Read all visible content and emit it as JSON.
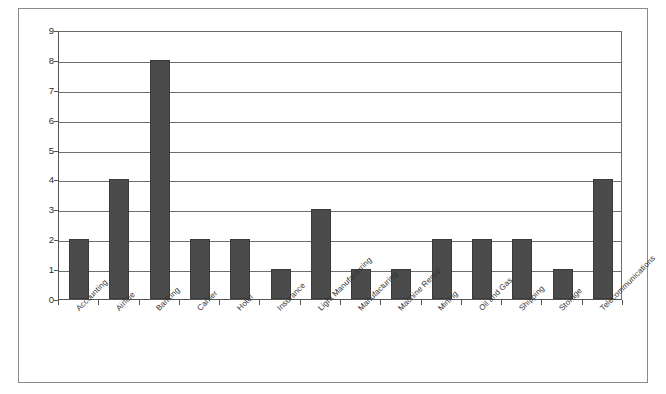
{
  "chart_data": {
    "type": "bar",
    "title": "",
    "subtitle": "",
    "xlabel": "",
    "ylabel": "",
    "categories": [
      "Accounting",
      "Airline",
      "Banking",
      "Carrier",
      "Hotel",
      "Insurance",
      "Light Manufacturing",
      "Manufacturing",
      "Machine Rental",
      "Mining",
      "Oil and Gas",
      "Shipping",
      "Storage",
      "Telecommunications"
    ],
    "values": [
      2,
      4,
      8,
      2,
      2,
      1,
      3,
      1,
      1,
      2,
      2,
      2,
      1,
      4
    ],
    "ylim": [
      0,
      9
    ],
    "ytick_labels": [
      "9",
      "8",
      "7",
      "6",
      "5",
      "4",
      "3",
      "2",
      "1",
      "0"
    ],
    "ytick_values": [
      9,
      8,
      7,
      6,
      5,
      4,
      3,
      2,
      1,
      0
    ],
    "grid": true,
    "grid_axis": "y",
    "legend": false,
    "legend_position": "none",
    "bar_color": "#4b4b4b",
    "grid_color": "#6e6e6e",
    "axis_color": "#555555",
    "background_color": "#ffffff",
    "xtick_rotation": -45
  },
  "figure": {
    "frame_border_color": "#8a8a8a"
  }
}
